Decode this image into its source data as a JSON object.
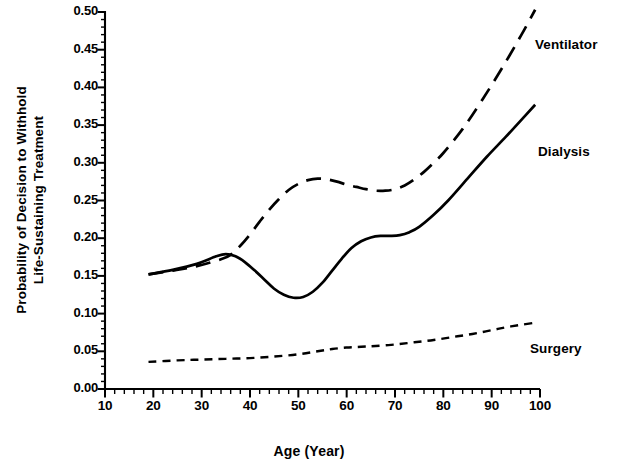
{
  "chart_data": {
    "type": "line",
    "title": "",
    "xlabel": "Age (Year)",
    "ylabel": "Probability of Decision to Withhold Life-Sustaining Treatment",
    "ylabel_line1": "Probability of Decision to Withhold",
    "ylabel_line2": "Life-Sustaining Treatment",
    "xlim": [
      10,
      100
    ],
    "ylim": [
      0.0,
      0.5
    ],
    "xticks": [
      10,
      20,
      30,
      40,
      50,
      60,
      70,
      80,
      90,
      100
    ],
    "xtick_labels": [
      "10",
      "20",
      "30",
      "40",
      "50",
      "60",
      "70",
      "80",
      "90",
      "100"
    ],
    "yticks": [
      0.0,
      0.05,
      0.1,
      0.15,
      0.2,
      0.25,
      0.3,
      0.35,
      0.4,
      0.45,
      0.5
    ],
    "ytick_labels": [
      "0.00",
      "0.05",
      "0.10",
      "0.15",
      "0.20",
      "0.25",
      "0.30",
      "0.35",
      "0.40",
      "0.45",
      "0.50"
    ],
    "x_minor_tick_step": 2,
    "y_minor_tick_step": 0.01,
    "grid": false,
    "legend_position": "right-inline-annotations",
    "line_color": "#000000",
    "series": [
      {
        "name": "Ventilator",
        "style": "long-dashed",
        "x": [
          19,
          24,
          29,
          34,
          36,
          38,
          40,
          42,
          44,
          46,
          48,
          50,
          52,
          54,
          56,
          58,
          60,
          62,
          64,
          66,
          68,
          70,
          72,
          74,
          76,
          78,
          80,
          84,
          88,
          92,
          96,
          99
        ],
        "y": [
          0.152,
          0.157,
          0.163,
          0.172,
          0.178,
          0.19,
          0.205,
          0.222,
          0.238,
          0.252,
          0.264,
          0.272,
          0.277,
          0.279,
          0.278,
          0.275,
          0.271,
          0.268,
          0.265,
          0.263,
          0.263,
          0.265,
          0.27,
          0.278,
          0.288,
          0.3,
          0.313,
          0.345,
          0.383,
          0.424,
          0.468,
          0.503
        ]
      },
      {
        "name": "Dialysis",
        "style": "solid",
        "x": [
          19,
          24,
          29,
          33,
          35,
          37,
          39,
          41,
          43,
          45,
          47,
          49,
          51,
          53,
          55,
          57,
          59,
          61,
          63,
          65,
          67,
          69,
          71,
          73,
          75,
          78,
          81,
          85,
          89,
          93,
          97,
          99
        ],
        "y": [
          0.152,
          0.158,
          0.166,
          0.176,
          0.179,
          0.176,
          0.168,
          0.157,
          0.145,
          0.133,
          0.125,
          0.121,
          0.122,
          0.129,
          0.141,
          0.157,
          0.173,
          0.187,
          0.196,
          0.201,
          0.203,
          0.203,
          0.204,
          0.208,
          0.215,
          0.231,
          0.25,
          0.279,
          0.308,
          0.335,
          0.363,
          0.377
        ]
      },
      {
        "name": "Surgery",
        "style": "short-dashed",
        "x": [
          19,
          25,
          30,
          35,
          40,
          45,
          50,
          54,
          57,
          60,
          63,
          66,
          70,
          74,
          78,
          82,
          86,
          90,
          94,
          99
        ],
        "y": [
          0.036,
          0.038,
          0.039,
          0.04,
          0.041,
          0.043,
          0.046,
          0.05,
          0.053,
          0.055,
          0.056,
          0.057,
          0.059,
          0.062,
          0.065,
          0.069,
          0.073,
          0.078,
          0.083,
          0.088
        ]
      }
    ],
    "annotations": [
      {
        "text": "Ventilator",
        "x_px": 535,
        "y_px": 37
      },
      {
        "text": "Dialysis",
        "x_px": 538,
        "y_px": 144
      },
      {
        "text": "Surgery",
        "x_px": 530,
        "y_px": 341
      }
    ]
  },
  "axis_geometry": {
    "plot_left_px": 105,
    "plot_right_px": 540,
    "plot_bottom_px": 389,
    "plot_top_px": 12
  }
}
